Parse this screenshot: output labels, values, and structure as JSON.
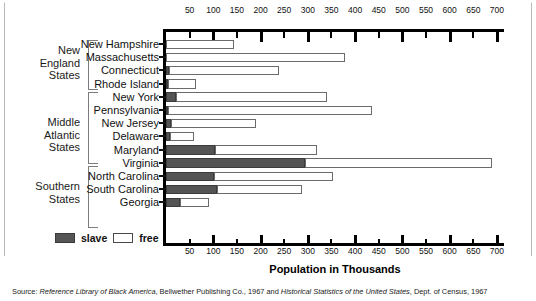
{
  "chart_data": {
    "type": "bar",
    "orientation": "horizontal",
    "stacked": true,
    "title": "",
    "xlabel": "Population in Thousands",
    "ylabel": "",
    "xlim": [
      0,
      715
    ],
    "xticks": [
      50,
      100,
      150,
      200,
      250,
      300,
      350,
      400,
      450,
      500,
      550,
      600,
      650,
      700
    ],
    "grid": false,
    "legend_position": "bottom-left",
    "legend": [
      "slave",
      "free"
    ],
    "series": [
      {
        "name": "slave",
        "color": "#545454"
      },
      {
        "name": "free",
        "color": "#ffffff"
      }
    ],
    "groups": [
      {
        "label": "New England\nStates",
        "states": [
          "New Hampshire",
          "Massachusetts",
          "Connecticut",
          "Rhode Island"
        ]
      },
      {
        "label": "Middle Atlantic\nStates",
        "states": [
          "New York",
          "Pennsylvania",
          "New Jersey",
          "Delaware",
          "Maryland"
        ]
      },
      {
        "label": "Southern States",
        "states": [
          "Virginia",
          "North Carolina",
          "South Carolina",
          "Georgia"
        ]
      }
    ],
    "categories": [
      "New Hampshire",
      "Massachusetts",
      "Connecticut",
      "Rhode Island",
      "New York",
      "Pennsylvania",
      "New Jersey",
      "Delaware",
      "Maryland",
      "Virginia",
      "North Carolina",
      "South Carolina",
      "Georgia"
    ],
    "values": {
      "slave": [
        0,
        0,
        6,
        1,
        21,
        4,
        11,
        9,
        103,
        293,
        101,
        107,
        29
      ],
      "free": [
        143,
        378,
        232,
        59,
        319,
        431,
        179,
        50,
        216,
        397,
        252,
        181,
        63
      ]
    },
    "totals": [
      143,
      378,
      238,
      60,
      340,
      435,
      190,
      59,
      319,
      690,
      353,
      288,
      92
    ]
  },
  "groups": {
    "new_england": {
      "line1": "New",
      "line2": "England",
      "line3": "States"
    },
    "middle_atlantic": {
      "line1": "Middle",
      "line2": "Atlantic",
      "line3": "States"
    },
    "southern": {
      "line1": "Southern",
      "line2": "States"
    }
  },
  "states": [
    {
      "name": "New Hampshire"
    },
    {
      "name": "Massachusetts"
    },
    {
      "name": "Connecticut"
    },
    {
      "name": "Rhode Island"
    },
    {
      "name": "New York"
    },
    {
      "name": "Pennsylvania"
    },
    {
      "name": "New Jersey"
    },
    {
      "name": "Delaware"
    },
    {
      "name": "Maryland"
    },
    {
      "name": "Virginia"
    },
    {
      "name": "North Carolina"
    },
    {
      "name": "South Carolina"
    },
    {
      "name": "Georgia"
    }
  ],
  "legend": {
    "slave_label": "slave",
    "free_label": "free"
  },
  "axis": {
    "title": "Population in Thousands"
  },
  "source": {
    "prefix": "Source: ",
    "ref1": "Reference Library of Black America",
    "mid": ", Bellwether Publishing Co., 1967 and ",
    "ref2": "Historical Statistics of the United States",
    "suffix": ", Dept. of Census, 1967"
  },
  "colors": {
    "slave": "#545454",
    "free": "#ffffff",
    "axis": "#000000"
  }
}
